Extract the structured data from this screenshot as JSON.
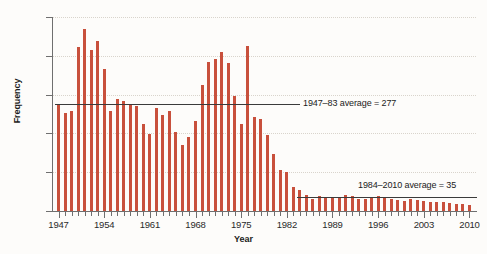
{
  "chart_data": {
    "type": "bar",
    "title": "",
    "xlabel": "Year",
    "ylabel": "Frequency",
    "ylim": [
      0,
      500
    ],
    "yticks": [
      0,
      100,
      200,
      300,
      400,
      500
    ],
    "xlim": [
      1947,
      2010
    ],
    "xticks": [
      1947,
      1954,
      1961,
      1968,
      1975,
      1982,
      1989,
      1996,
      2003,
      2010
    ],
    "grid": true,
    "legend": "none",
    "bar_color": "#c8503c",
    "categories": [
      1947,
      1948,
      1949,
      1950,
      1951,
      1952,
      1953,
      1954,
      1955,
      1956,
      1957,
      1958,
      1959,
      1960,
      1961,
      1962,
      1963,
      1964,
      1965,
      1966,
      1967,
      1968,
      1969,
      1970,
      1971,
      1972,
      1973,
      1974,
      1975,
      1976,
      1977,
      1978,
      1979,
      1980,
      1981,
      1982,
      1983,
      1984,
      1985,
      1986,
      1987,
      1988,
      1989,
      1990,
      1991,
      1992,
      1993,
      1994,
      1995,
      1996,
      1997,
      1998,
      1999,
      2000,
      2001,
      2002,
      2003,
      2004,
      2005,
      2006,
      2007,
      2008,
      2009,
      2010
    ],
    "values": [
      272,
      253,
      258,
      424,
      470,
      415,
      437,
      365,
      258,
      288,
      283,
      272,
      270,
      225,
      198,
      265,
      247,
      258,
      203,
      171,
      191,
      233,
      324,
      383,
      393,
      410,
      382,
      297,
      223,
      425,
      243,
      238,
      196,
      148,
      105,
      100,
      63,
      55,
      40,
      30,
      38,
      37,
      35,
      33,
      40,
      38,
      30,
      30,
      37,
      38,
      33,
      30,
      28,
      25,
      30,
      28,
      25,
      22,
      24,
      22,
      20,
      18,
      17,
      15
    ],
    "annotations": [
      {
        "name": "avg-1947-83",
        "label": "1947–83 average = 277",
        "value": 277,
        "x_start": 1947,
        "x_end": 1983
      },
      {
        "name": "avg-1984-2010",
        "label": "1984–2010 average = 35",
        "value": 35,
        "x_start": 1984,
        "x_end": 2010
      }
    ]
  }
}
